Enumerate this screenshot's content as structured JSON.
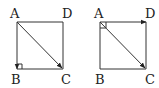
{
  "figures": [
    {
      "name": "left",
      "labels": {
        "A": "A",
        "B": "B",
        "C": "C",
        "D": "D"
      },
      "vectors": [
        "AB",
        "AC"
      ],
      "right_angle_at": "B"
    },
    {
      "name": "right",
      "labels": {
        "A": "A",
        "B": "B",
        "C": "C",
        "D": "D"
      },
      "vectors": [
        "AD",
        "AC"
      ],
      "right_angle_at": "A"
    }
  ],
  "colors": {
    "stroke": "#333333",
    "text": "#222222",
    "background": "#ffffff"
  }
}
